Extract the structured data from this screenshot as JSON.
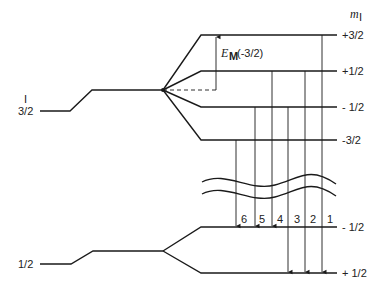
{
  "diagram": {
    "axis_label": "m",
    "axis_label_sub": "I",
    "upper_state": {
      "label_top": "I",
      "label_spin": "3/2",
      "sublevels": [
        "+3/2",
        "+1/2",
        "- 1/2",
        "-3/2"
      ]
    },
    "lower_state": {
      "label_spin": "1/2",
      "sublevels": [
        "- 1/2",
        "+ 1/2"
      ]
    },
    "energy_annotation": {
      "symbol": "E",
      "subscript": "M",
      "argument": "(-3/2)"
    },
    "transitions": [
      "6",
      "5",
      "4",
      "3",
      "2",
      "1"
    ]
  }
}
